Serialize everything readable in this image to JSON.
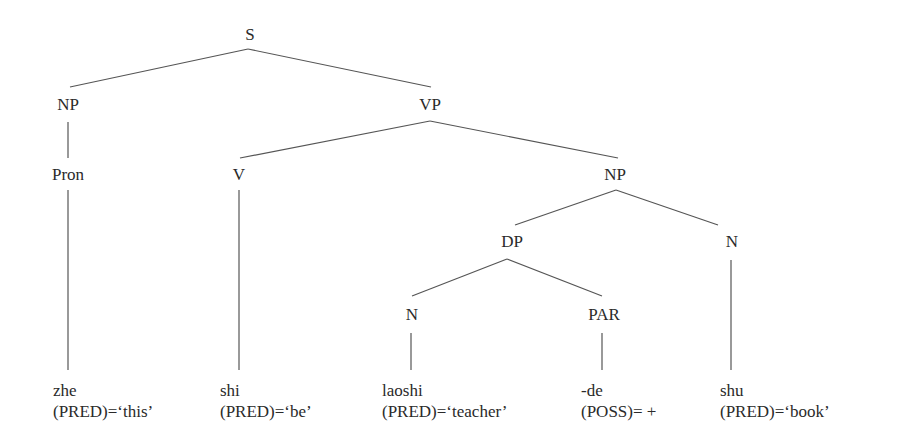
{
  "diagram": {
    "type": "syntax-tree",
    "nodes": {
      "s": "S",
      "np_subject": "NP",
      "vp": "VP",
      "pron": "Pron",
      "v": "V",
      "np_object": "NP",
      "dp": "DP",
      "n_head": "N",
      "n_dp": "N",
      "par": "PAR"
    },
    "leaves": [
      {
        "word": "zhe",
        "feature": "(PRED)=‘this’"
      },
      {
        "word": "shi",
        "feature": "(PRED)=‘be’"
      },
      {
        "word": "laoshi",
        "feature": "(PRED)=‘teacher’"
      },
      {
        "word": "-de",
        "feature": "(POSS)= +"
      },
      {
        "word": "shu",
        "feature": "(PRED)=‘book’"
      }
    ],
    "line_color": "#555555"
  }
}
